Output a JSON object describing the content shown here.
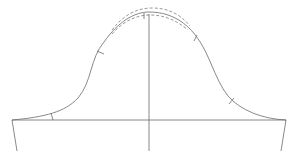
{
  "diagram": {
    "type": "sleeve-pattern-draft",
    "width": 298,
    "height": 165,
    "colors": {
      "line": "#6b6b6b",
      "background": "#ffffff"
    },
    "baseline": {
      "x1": 12,
      "y1": 120,
      "x2": 286,
      "y2": 120
    },
    "center_line": {
      "x1": 149,
      "y1": 14,
      "x2": 149,
      "y2": 151
    },
    "left_edge": {
      "x1": 12,
      "y1": 120,
      "x2": 17,
      "y2": 151
    },
    "right_edge": {
      "x1": 286,
      "y1": 120,
      "x2": 281,
      "y2": 151
    },
    "notches": [
      {
        "name": "left-lower",
        "x": 52,
        "y": 119
      },
      {
        "name": "left-upper",
        "x": 100,
        "y": 52
      },
      {
        "name": "crown",
        "x": 144,
        "y": 16
      },
      {
        "name": "right-upper",
        "x": 196,
        "y": 38
      },
      {
        "name": "right-lower",
        "x": 232,
        "y": 101
      }
    ]
  }
}
